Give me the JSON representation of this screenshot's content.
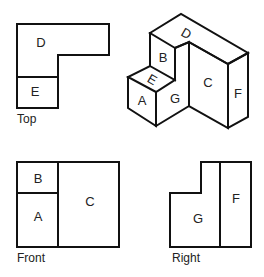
{
  "views": {
    "top": {
      "caption": "Top",
      "faces": [
        "D",
        "E"
      ]
    },
    "isometric": {
      "faces": [
        "D",
        "B",
        "E",
        "A",
        "G",
        "C",
        "F"
      ]
    },
    "front": {
      "caption": "Front",
      "faces": [
        "B",
        "A",
        "C"
      ]
    },
    "right": {
      "caption": "Right",
      "faces": [
        "G",
        "F"
      ]
    }
  },
  "labels": {
    "top_D": "D",
    "top_E": "E",
    "iso_D": "D",
    "iso_B": "B",
    "iso_E": "E",
    "iso_A": "A",
    "iso_G": "G",
    "iso_C": "C",
    "iso_F": "F",
    "front_B": "B",
    "front_A": "A",
    "front_C": "C",
    "right_G": "G",
    "right_F": "F"
  },
  "colors": {
    "line": "#111111",
    "text": "#222222",
    "background": "#ffffff"
  }
}
